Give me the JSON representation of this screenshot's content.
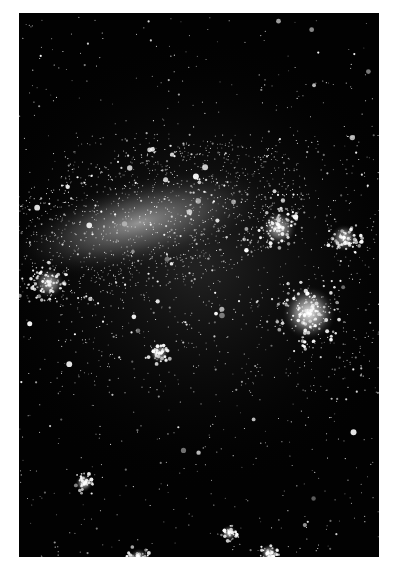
{
  "image": {
    "subject": "Large Magellanic Cloud star field",
    "description": "Black-and-white astronomical photograph of a galaxy with a bright diagonal bar of stars and nebulous star-forming regions",
    "frame": {
      "x": 19,
      "y": 13,
      "width": 360,
      "height": 544
    },
    "background_color": "#ffffff",
    "sky_color": "#020202",
    "star_color": "#ffffff"
  },
  "features": {
    "bar": {
      "label": "galactic bar",
      "cx": 120,
      "cy": 210,
      "rx": 135,
      "ry": 45,
      "rotate": -14,
      "intensity": 0.75
    },
    "nebulae": [
      {
        "label": "bright nebula right",
        "cx": 290,
        "cy": 300,
        "r": 28,
        "intensity": 0.95
      },
      {
        "label": "nebula upper right",
        "cx": 260,
        "cy": 215,
        "r": 18,
        "intensity": 0.7
      },
      {
        "label": "nebula far right",
        "cx": 325,
        "cy": 225,
        "r": 14,
        "intensity": 0.7
      },
      {
        "label": "nebula left edge",
        "cx": 30,
        "cy": 270,
        "r": 16,
        "intensity": 0.7
      },
      {
        "label": "nebula center",
        "cx": 140,
        "cy": 340,
        "r": 10,
        "intensity": 0.7
      },
      {
        "label": "nebula lower left",
        "cx": 65,
        "cy": 470,
        "r": 9,
        "intensity": 0.8
      },
      {
        "label": "nebula bottom center",
        "cx": 210,
        "cy": 520,
        "r": 8,
        "intensity": 0.8
      },
      {
        "label": "nebula bottom right",
        "cx": 250,
        "cy": 540,
        "r": 9,
        "intensity": 0.8
      },
      {
        "label": "nebula bottom left",
        "cx": 120,
        "cy": 545,
        "r": 10,
        "intensity": 0.7
      }
    ],
    "star_count": 2600,
    "seed": 42
  }
}
